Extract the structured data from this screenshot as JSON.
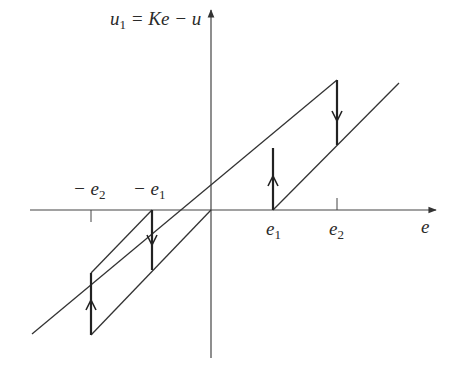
{
  "diagram": {
    "type": "hysteresis-characteristic",
    "y_axis_label": {
      "lhs": "u",
      "lhs_sub": "1",
      "rhs": " = Ke − u"
    },
    "x_axis_label": "e",
    "tick_labels": {
      "neg_e2": {
        "sign": "− ",
        "sym": "e",
        "sub": "2"
      },
      "neg_e1": {
        "sign": "− ",
        "sym": "e",
        "sub": "1"
      },
      "e1": {
        "sym": "e",
        "sub": "1"
      },
      "e2": {
        "sym": "e",
        "sub": "2"
      }
    },
    "arrows": [
      "up at e1",
      "down at e2",
      "down at -e1",
      "up at -e2"
    ],
    "line_color": "#333333"
  }
}
